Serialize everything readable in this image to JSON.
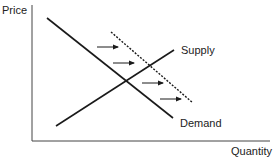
{
  "diagram": {
    "axes": {
      "y_label": "Price",
      "x_label": "Quantity"
    },
    "curves": [
      {
        "name": "Demand",
        "label": "Demand",
        "style": "solid",
        "from": [
          47,
          18
        ],
        "to": [
          173,
          118
        ]
      },
      {
        "name": "Supply",
        "label": "Supply",
        "style": "solid",
        "from": [
          56,
          126
        ],
        "to": [
          174,
          50
        ]
      },
      {
        "name": "Shifted Demand",
        "label": "",
        "style": "dashed",
        "from": [
          111,
          32
        ],
        "to": [
          193,
          103
        ]
      }
    ],
    "arrows": [
      {
        "from": [
          97,
          47
        ],
        "to": [
          118,
          47
        ]
      },
      {
        "from": [
          113,
          63
        ],
        "to": [
          134,
          63
        ]
      },
      {
        "from": [
          142,
          83
        ],
        "to": [
          163,
          83
        ]
      },
      {
        "from": [
          160,
          99
        ],
        "to": [
          181,
          99
        ]
      }
    ],
    "colors": {
      "line": "#1a1a1a",
      "axis": "#444444",
      "text": "#222222"
    }
  }
}
